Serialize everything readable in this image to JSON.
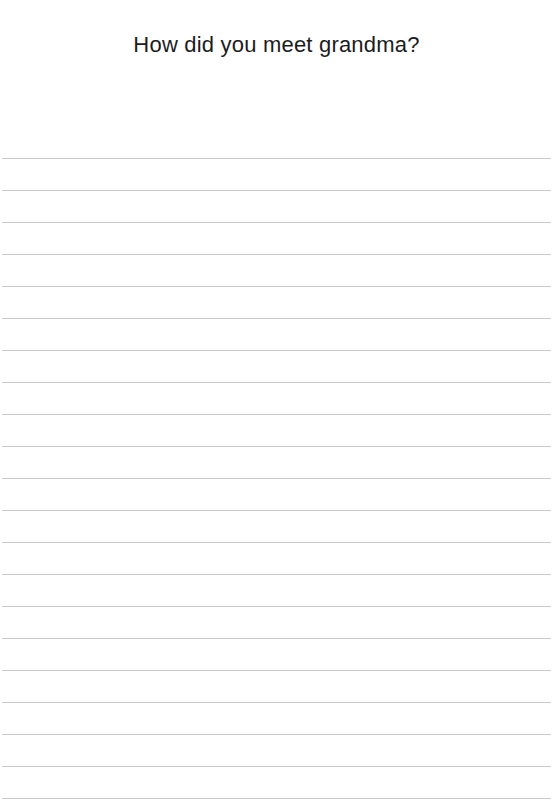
{
  "page": {
    "type": "lined-writing-prompt-sheet",
    "width": 553,
    "height": 812,
    "background_color": "#ffffff"
  },
  "header": {
    "title": "How did you meet grandma?",
    "title_color": "#1c1c1e",
    "title_font_size_px": 22,
    "title_align": "center"
  },
  "writing_area": {
    "line_count": 21,
    "line_color": "#c9c9cd",
    "line_thickness_px": 1,
    "first_line_y": 158,
    "line_spacing_px": 32,
    "line_left_inset_px": 2,
    "line_width_px": 549,
    "content": ""
  }
}
